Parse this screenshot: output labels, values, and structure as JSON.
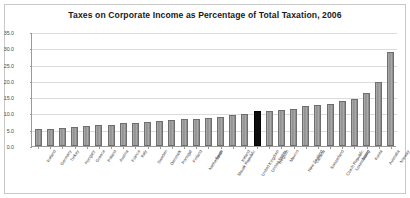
{
  "chart_data": {
    "type": "bar",
    "title": "Taxes on Corporate Income as Percentage of Total Taxation, 2006",
    "xlabel": "",
    "ylabel": "",
    "ylim": [
      0.0,
      35.0
    ],
    "ytick_step": 5.0,
    "ytick_labels": [
      "0.0",
      "5.0",
      "10.0",
      "15.0",
      "20.0",
      "25.0",
      "30.0",
      "35.0"
    ],
    "grid": true,
    "legend": "none",
    "highlight_color": "#0d0d0d",
    "bar_color": "#999999",
    "highlight_category": "United States",
    "categories": [
      "Iceland",
      "Germany",
      "Turkey",
      "Hungary",
      "Greece",
      "Poland",
      "Austria",
      "France",
      "Italy",
      "Sweden",
      "Denmark",
      "Portugal",
      "Finland",
      "Netherlands",
      "Spain",
      "Slovak Republic",
      "Ireland",
      "United Kingdom",
      "United States",
      "Belgium",
      "Mexico",
      "New Zealand",
      "Canada",
      "Switzerland",
      "Czech Republic",
      "Luxembourg",
      "Japan",
      "Korea",
      "Australia",
      "Norway"
    ],
    "values": [
      5.1,
      5.3,
      5.5,
      5.8,
      6.0,
      6.4,
      6.6,
      7.0,
      7.2,
      7.5,
      7.7,
      8.0,
      8.2,
      8.4,
      8.6,
      8.9,
      9.4,
      9.8,
      10.6,
      10.9,
      11.1,
      11.4,
      12.2,
      12.6,
      12.9,
      13.7,
      14.5,
      16.3,
      19.7,
      28.9
    ]
  }
}
